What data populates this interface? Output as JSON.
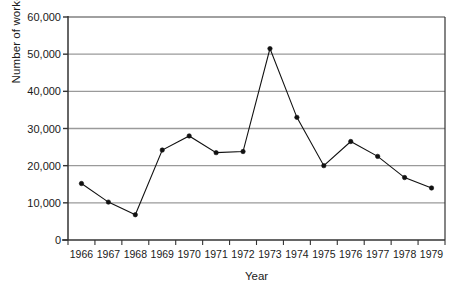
{
  "chart_data": {
    "type": "line",
    "title": "",
    "xlabel": "Year",
    "ylabel": "Number of workers",
    "categories": [
      "1966",
      "1967",
      "1968",
      "1969",
      "1970",
      "1971",
      "1972",
      "1973",
      "1974",
      "1975",
      "1976",
      "1977",
      "1978",
      "1979"
    ],
    "values": [
      15200,
      10200,
      6800,
      24200,
      28000,
      23500,
      23800,
      51500,
      33000,
      20000,
      26500,
      22500,
      16800,
      14000
    ],
    "series": [
      {
        "name": "Number of workers",
        "values": [
          15200,
          10200,
          6800,
          24200,
          28000,
          23500,
          23800,
          51500,
          33000,
          20000,
          26500,
          22500,
          16800,
          14000
        ]
      }
    ],
    "xlim": [
      1966,
      1979
    ],
    "ylim": [
      0,
      60000
    ],
    "ytick_labels": [
      "0",
      "10,000",
      "20,000",
      "30,000",
      "40,000",
      "50,000",
      "60,000"
    ],
    "ytick_values": [
      0,
      10000,
      20000,
      30000,
      40000,
      50000,
      60000
    ],
    "grid": true,
    "grid_axis": "y",
    "legend": false,
    "marker": "filled-circle",
    "line_color": "#111111",
    "marker_color": "#111111",
    "grid_color": "#9a9a9a",
    "axis_color": "#333333",
    "background": "#ffffff"
  }
}
